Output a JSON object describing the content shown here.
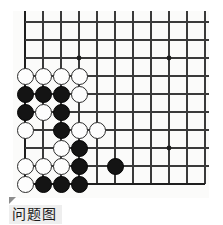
{
  "diagram": {
    "kind": "go-board-diagram",
    "caption": "问题图",
    "caption_marker_icon": "triangle-marker-icon",
    "board": {
      "background_color": "#fbfbfa",
      "line_color": "#3a3a3a",
      "edge_color": "#1e1e1e",
      "grid_spacing": 18,
      "origin_x": 12,
      "origin_y": 11,
      "columns": 11,
      "rows": 10,
      "edges": {
        "left": true,
        "bottom": true,
        "top": false,
        "right": false
      },
      "star_points": [
        {
          "col": 3,
          "row": 2
        },
        {
          "col": 8,
          "row": 2
        },
        {
          "col": 8,
          "row": 7
        }
      ]
    },
    "stones": [
      {
        "color": "white",
        "col": 0,
        "row": 3
      },
      {
        "color": "white",
        "col": 1,
        "row": 3
      },
      {
        "color": "white",
        "col": 2,
        "row": 3
      },
      {
        "color": "white",
        "col": 3,
        "row": 3
      },
      {
        "color": "black",
        "col": 0,
        "row": 4
      },
      {
        "color": "black",
        "col": 1,
        "row": 4
      },
      {
        "color": "black",
        "col": 2,
        "row": 4
      },
      {
        "color": "white",
        "col": 3,
        "row": 4
      },
      {
        "color": "black",
        "col": 0,
        "row": 5
      },
      {
        "color": "white",
        "col": 1,
        "row": 5
      },
      {
        "color": "black",
        "col": 2,
        "row": 5
      },
      {
        "color": "white",
        "col": 0,
        "row": 6
      },
      {
        "color": "black",
        "col": 2,
        "row": 6
      },
      {
        "color": "white",
        "col": 3,
        "row": 6
      },
      {
        "color": "white",
        "col": 4,
        "row": 6
      },
      {
        "color": "white",
        "col": 2,
        "row": 7
      },
      {
        "color": "black",
        "col": 3,
        "row": 7
      },
      {
        "color": "white",
        "col": 0,
        "row": 8
      },
      {
        "color": "white",
        "col": 1,
        "row": 8
      },
      {
        "color": "white",
        "col": 2,
        "row": 8
      },
      {
        "color": "black",
        "col": 3,
        "row": 8
      },
      {
        "color": "white",
        "col": 0,
        "row": 9
      },
      {
        "color": "black",
        "col": 1,
        "row": 9
      },
      {
        "color": "black",
        "col": 2,
        "row": 9
      },
      {
        "color": "black",
        "col": 3,
        "row": 9
      },
      {
        "color": "black",
        "col": 5,
        "row": 8
      }
    ],
    "stone_counts": {
      "black": 13,
      "white": 13,
      "total": 26
    }
  }
}
